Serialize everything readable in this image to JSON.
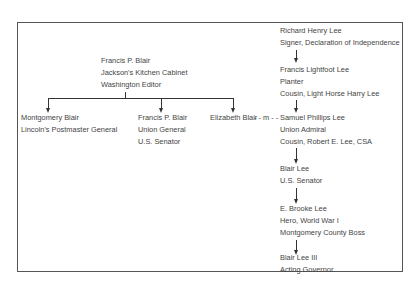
{
  "blair_family": {
    "root": {
      "name": "Francis P. Blair",
      "lines": [
        "Francis P. Blair",
        "Jackson's Kitchen Cabinet",
        "Washington Editor"
      ]
    },
    "children": [
      {
        "name": "Montgomery Blair",
        "lines": [
          "Montgomery Blair",
          "Lincoln's Postmaster General"
        ]
      },
      {
        "name": "Francis P. Blair",
        "lines": [
          "Francis P. Blair",
          "Union General",
          "U.S. Senator"
        ]
      },
      {
        "name": "Elizabeth Blair",
        "lines": [
          "Elizabeth Blair"
        ]
      }
    ]
  },
  "marriage": {
    "label": "- - m - -"
  },
  "lee_family": [
    {
      "name": "Richard Henry Lee",
      "lines": [
        "Richard Henry Lee",
        "Signer, Declaration of Independence"
      ]
    },
    {
      "name": "Francis Lightfoot Lee",
      "lines": [
        "Francis Lightfoot Lee",
        "Planter",
        "Cousin, Light Horse Harry Lee"
      ]
    },
    {
      "name": "Samuel Phillips Lee",
      "lines": [
        "Samuel Phillips Lee",
        "Union Admiral",
        "Cousin, Robert E. Lee, CSA"
      ]
    },
    {
      "name": "Blair Lee",
      "lines": [
        "Blair Lee",
        "U.S. Senator"
      ]
    },
    {
      "name": "E. Brooke Lee",
      "lines": [
        "E. Brooke Lee",
        "Hero, World War I",
        "Montgomery County Boss"
      ]
    },
    {
      "name": "Blair Lee III",
      "lines": [
        "Blair Lee III",
        "Acting Governor"
      ]
    }
  ]
}
